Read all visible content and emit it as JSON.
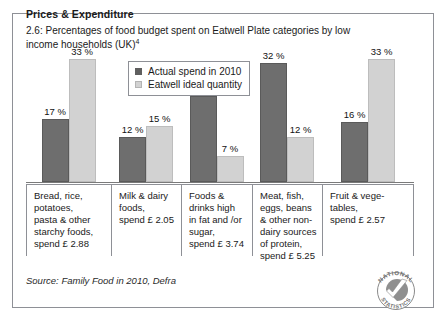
{
  "figure": {
    "heading": "Prices & Expenditure",
    "subtitle_line1": "2.6: Percentages of food budget spent on Eatwell Plate",
    "subtitle_line2": "categories by low income households (UK)",
    "footnote_marker": "4",
    "source": "Source: Family Food in 2010, Defra",
    "logo_text_top": "NATIONAL",
    "logo_text_bottom": "STATISTICS",
    "logo_name": "national-statistics-logo"
  },
  "colors": {
    "actual": "#6e6e6e",
    "ideal": "#d2d2d2",
    "frame": "#8e9096",
    "axis": "#7a7a7a",
    "text": "#1a1a1a"
  },
  "chart_data": {
    "type": "bar",
    "title": "2.6: Percentages of food budget spent on Eatwell Plate categories by low income households (UK)",
    "xlabel": "",
    "ylabel": "",
    "ylim": [
      0,
      36
    ],
    "grid": false,
    "legend_position": "top-center",
    "value_suffix": " %",
    "categories": [
      "Bread, rice, potatoes, pasta & other starchy foods, spend £ 2.88",
      "Milk & dairy foods, spend £ 2.05",
      "Foods & drinks high in fat and /or sugar, spend £ 3.74",
      "Meat, fish, eggs, beans & other non-dairy sources of protein, spend £ 5.25",
      "Fruit & vegetables, spend £ 2.57"
    ],
    "category_labels": [
      [
        "Bread, rice,",
        "potatoes,",
        "pasta & other",
        "starchy foods,",
        "spend £ 2.88"
      ],
      [
        "Milk & dairy",
        "foods,",
        "spend £ 2.05"
      ],
      [
        "Foods &",
        "drinks high",
        "in fat and /or",
        "sugar,",
        "spend £ 3.74"
      ],
      [
        "Meat, fish,",
        "eggs, beans",
        "& other non-",
        "dairy sources",
        "of protein,",
        "spend £ 5.25"
      ],
      [
        "Fruit & vege-",
        "tables,",
        "spend £ 2.57"
      ]
    ],
    "series": [
      {
        "name": "Actual spend in 2010",
        "color": "#6e6e6e",
        "values": [
          17,
          12,
          23,
          32,
          16
        ],
        "labels": [
          "17 %",
          "12 %",
          "23 %",
          "32 %",
          "16 %"
        ]
      },
      {
        "name": "Eatwell ideal quantity",
        "color": "#d2d2d2",
        "values": [
          33,
          15,
          7,
          12,
          33
        ],
        "labels": [
          "33 %",
          "15 %",
          "7 %",
          "12 %",
          "33 %"
        ]
      }
    ]
  }
}
